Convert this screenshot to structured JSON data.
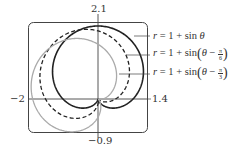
{
  "chart_data": {
    "type": "line",
    "subtype": "polar",
    "title": "",
    "xlabel": "",
    "ylabel": "",
    "xlim": [
      -2,
      1.4
    ],
    "ylim": [
      -0.9,
      2.1
    ],
    "tick_labels": {
      "xmin": "−2",
      "xmax": "1.4",
      "ymin": "−0.9",
      "ymax": "2.1"
    },
    "grid": false,
    "legend_position": "right (leader-line annotations)",
    "series": [
      {
        "name": "r = 1 + sin θ",
        "phase": 0,
        "style": "solid",
        "color": "#222222",
        "width": 1.6
      },
      {
        "name": "r = 1 + sin(θ − π/6)",
        "phase": 0.5235987756,
        "style": "dashed",
        "color": "#222222",
        "width": 1.3
      },
      {
        "name": "r = 1 + sin(θ − π/3)",
        "phase": 1.0471975512,
        "style": "solid",
        "color": "#aaaaaa",
        "width": 1.3
      }
    ]
  },
  "labels": {
    "ymax": "2.1",
    "xmin": "−2",
    "xmax": "1.4",
    "ymin": "−0.9",
    "eq1": {
      "lhs": "r",
      "rhs": " = 1 + sin ",
      "theta": "θ"
    },
    "eq2": {
      "lhs": "r",
      "rhs": " = 1 + sin",
      "theta": "θ",
      "minus": " − ",
      "num": "π",
      "den": "6"
    },
    "eq3": {
      "lhs": "r",
      "rhs": " = 1 + sin",
      "theta": "θ",
      "minus": " − ",
      "num": "π",
      "den": "3"
    }
  }
}
